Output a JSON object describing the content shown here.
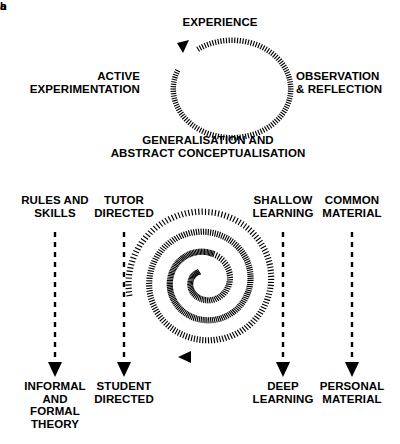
{
  "figure": {
    "panels": [
      {
        "letter": "a",
        "name": "experiential-learning-cycle",
        "cycle_labels": [
          {
            "id": "experience",
            "text": "EXPERIENCE",
            "position": "top"
          },
          {
            "id": "observation",
            "text": "OBSERVATION\n& REFLECTION",
            "position": "right"
          },
          {
            "id": "generalisation",
            "text": "GENERALISATION AND\nABSTRACT CONCEPTUALISATION",
            "position": "bottom"
          },
          {
            "id": "active",
            "text": "ACTIVE\nEXPERIMENTATION",
            "position": "left"
          }
        ],
        "cycle_direction": "clockwise",
        "arrowhead_position": "top-left"
      },
      {
        "letter": "b",
        "name": "learning-spiral-dimensions",
        "columns": [
          {
            "id": "rules-theory",
            "top": "RULES AND\nSKILLS",
            "bottom": "INFORMAL\nAND\nFORMAL\nTHEORY"
          },
          {
            "id": "tutor-student",
            "top": "TUTOR\nDIRECTED",
            "bottom": "STUDENT\nDIRECTED"
          },
          {
            "id": "shallow-deep",
            "top": "SHALLOW\nLEARNING",
            "bottom": "DEEP\nLEARNING"
          },
          {
            "id": "common-personal",
            "top": "COMMON\nMATERIAL",
            "bottom": "PERSONAL\nMATERIAL"
          }
        ],
        "spiral": {
          "direction": "inward",
          "turns": 3,
          "arrowhead_position": "bottom-left"
        }
      }
    ],
    "colors": {
      "ink": "#000000",
      "background": "#ffffff"
    }
  }
}
